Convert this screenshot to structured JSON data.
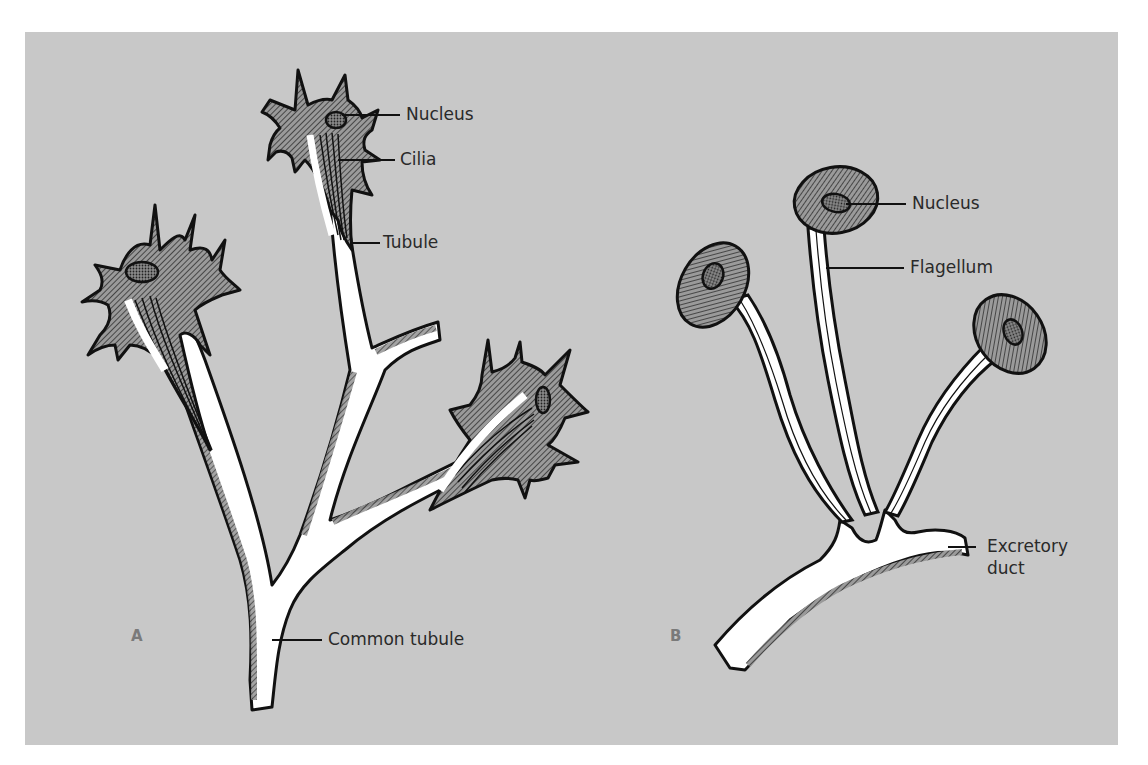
{
  "figure": {
    "background_color": "#c8c8c8",
    "page_color": "#ffffff",
    "ink_color": "#111111",
    "panels": [
      {
        "id": "A",
        "letter": "A",
        "description": "Flame cells with tufts of cilia joined by tubules to a common tubule",
        "labels": {
          "nucleus": "Nucleus",
          "cilia": "Cilia",
          "tubule": "Tubule",
          "common_tubule": "Common tubule"
        }
      },
      {
        "id": "B",
        "letter": "B",
        "description": "Solenocytes with single flagella joined to an excretory duct",
        "labels": {
          "nucleus": "Nucleus",
          "flagellum": "Flagellum",
          "excretory_duct_line1": "Excretory",
          "excretory_duct_line2": "duct"
        }
      }
    ]
  }
}
